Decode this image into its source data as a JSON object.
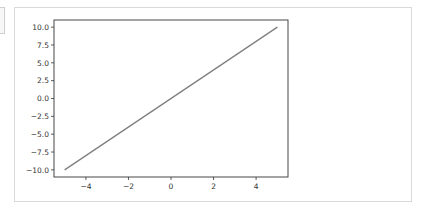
{
  "chart_data": {
    "type": "line",
    "title": "",
    "xlabel": "",
    "ylabel": "",
    "xlim": [
      -5.5,
      5.5
    ],
    "ylim": [
      -11,
      11
    ],
    "grid": false,
    "legend": null,
    "x_ticks": [
      -4,
      -2,
      0,
      2,
      4
    ],
    "x_tick_labels": [
      "−4",
      "−2",
      "0",
      "2",
      "4"
    ],
    "y_ticks": [
      10.0,
      7.5,
      5.0,
      2.5,
      0.0,
      -2.5,
      -5.0,
      -7.5,
      -10.0
    ],
    "y_tick_labels": [
      "10.0",
      "7.5",
      "5.0",
      "2.5",
      "0.0",
      "−2.5",
      "−5.0",
      "−7.5",
      "−10.0"
    ],
    "series": [
      {
        "name": "y = 2x",
        "x": [
          -5,
          5
        ],
        "y": [
          -10,
          10
        ],
        "color": "#7f7f7f"
      }
    ]
  },
  "colors": {
    "line": "#7f7f7f",
    "axes": "#333333",
    "frame": "#d9d9d9"
  }
}
